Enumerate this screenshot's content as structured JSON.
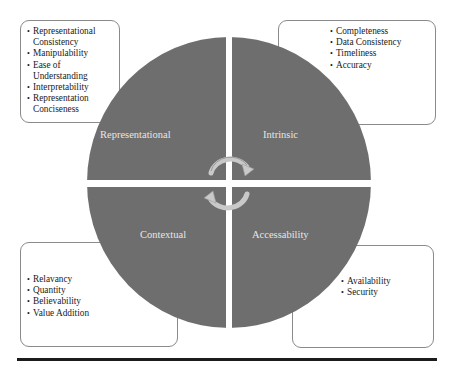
{
  "diagram": {
    "type": "quadrant-circle",
    "colors": {
      "circle_fill": "#6e6e6e",
      "divider": "#ffffff",
      "label_text": "#e6e6e6",
      "box_border": "#8a8a8a",
      "rule": "#1c1c1c"
    },
    "center_icon": "cycle-arrows-icon",
    "quadrants": [
      {
        "id": "representational",
        "label": "Representational",
        "position": "top-left",
        "items": [
          "Representational Consistency",
          "Manipulability",
          "Ease of Understanding",
          "Interpretability",
          "Representation Conciseness"
        ]
      },
      {
        "id": "intrinsic",
        "label": "Intrinsic",
        "position": "top-right",
        "items": [
          "Completeness",
          "Data Consistency",
          "Timeliness",
          "Accuracy"
        ]
      },
      {
        "id": "contextual",
        "label": "Contextual",
        "position": "bottom-left",
        "items": [
          "Relavancy",
          "Quantity",
          "Believability",
          "Value Addition"
        ]
      },
      {
        "id": "accessability",
        "label": "Accessability",
        "position": "bottom-right",
        "items": [
          "Availability",
          "Security"
        ]
      }
    ]
  }
}
